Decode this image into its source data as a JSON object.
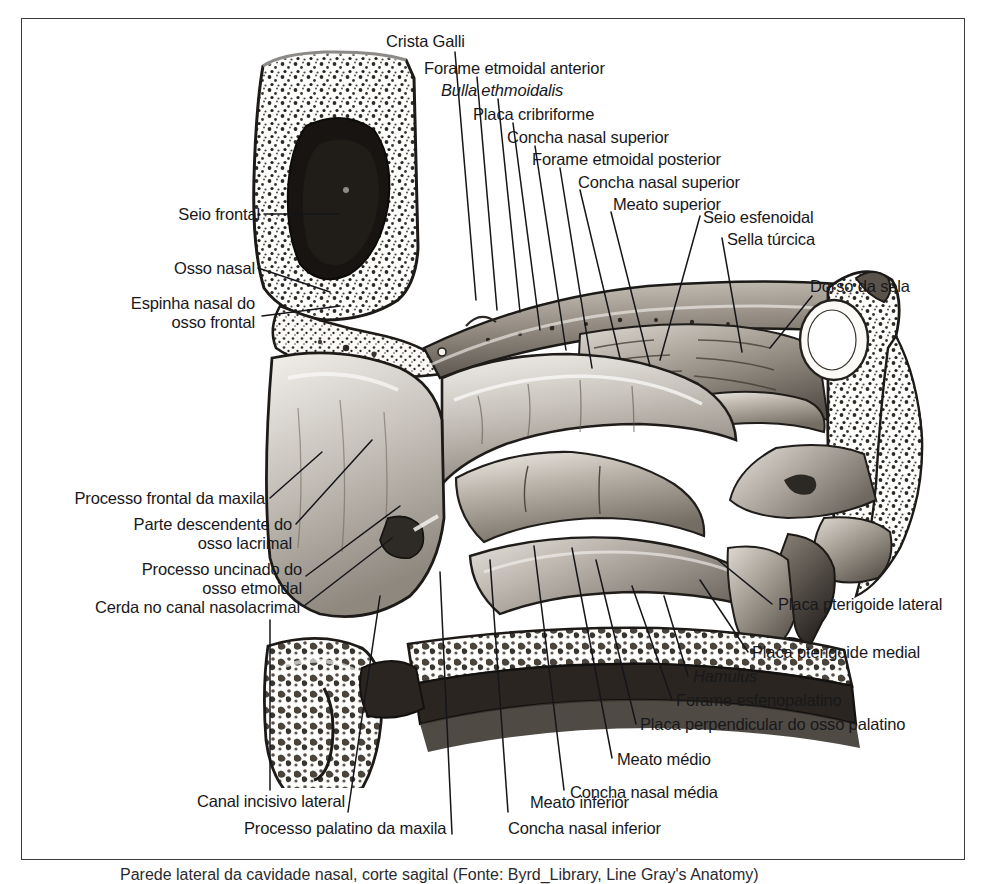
{
  "figure": {
    "language": "pt-BR",
    "frame_color": "#3b3b41",
    "text_color": "#18181c",
    "background": "#ffffff"
  },
  "labels_top": [
    {
      "id": "crista-galli",
      "text": "Crista Galli",
      "italic": false
    },
    {
      "id": "forame-etmoidal-anterior",
      "text": "Forame etmoidal anterior",
      "italic": false
    },
    {
      "id": "bulla-ethmoidalis",
      "text": "Bulla ethmoidalis",
      "italic": true
    },
    {
      "id": "placa-cribriforme",
      "text": "Placa cribriforme",
      "italic": false
    },
    {
      "id": "concha-nasal-superior-1",
      "text": "Concha nasal superior",
      "italic": false
    },
    {
      "id": "forame-etmoidal-posterior",
      "text": "Forame etmoidal posterior",
      "italic": false
    },
    {
      "id": "concha-nasal-superior-2",
      "text": "Concha nasal superior",
      "italic": false
    },
    {
      "id": "meato-superior",
      "text": "Meato superior",
      "italic": false
    },
    {
      "id": "seio-esfenoidal",
      "text": "Seio esfenoidal",
      "italic": false
    },
    {
      "id": "sella-turcica",
      "text": "Sella túrcica",
      "italic": false
    }
  ],
  "labels_left": [
    {
      "id": "seio-frontal",
      "text": "Seio frontal",
      "italic": false
    },
    {
      "id": "osso-nasal",
      "text": "Osso nasal",
      "italic": false
    },
    {
      "id": "espinha-nasal-do-osso-frontal-l1",
      "text": "Espinha nasal do",
      "italic": false
    },
    {
      "id": "espinha-nasal-do-osso-frontal-l2",
      "text": "osso frontal",
      "italic": false
    },
    {
      "id": "processo-frontal-da-maxila",
      "text": "Processo frontal da maxila",
      "italic": false
    },
    {
      "id": "parte-descendente-osso-lacrimal-l1",
      "text": "Parte descendente do",
      "italic": false
    },
    {
      "id": "parte-descendente-osso-lacrimal-l2",
      "text": "osso lacrimal",
      "italic": false
    },
    {
      "id": "processo-uncinado-osso-etmoidal-l1",
      "text": "Processo uncinado do",
      "italic": false
    },
    {
      "id": "processo-uncinado-osso-etmoidal-l2",
      "text": "osso etmoidal",
      "italic": false
    },
    {
      "id": "cerda-no-canal-nasolacrimal",
      "text": "Cerda no canal nasolacrimal",
      "italic": false
    }
  ],
  "labels_right": [
    {
      "id": "dorso-da-sela",
      "text": "Dorso da sela",
      "italic": false
    },
    {
      "id": "placa-pterigoide-lateral",
      "text": "Placa pterigoide lateral",
      "italic": false
    },
    {
      "id": "placa-pterigoide-medial",
      "text": "Placa pterigoide medial",
      "italic": false
    },
    {
      "id": "hamulus",
      "text": "Hamulus",
      "italic": true
    },
    {
      "id": "forame-esfenopalatino",
      "text": "Forame esfenopalatino",
      "italic": false
    },
    {
      "id": "placa-perpendicular-osso-palatino",
      "text": "Placa perpendicular do osso palatino",
      "italic": false
    },
    {
      "id": "meato-medio",
      "text": "Meato médio",
      "italic": false
    },
    {
      "id": "concha-nasal-media",
      "text": "Concha nasal média",
      "italic": false
    }
  ],
  "labels_bottom": [
    {
      "id": "canal-incisivo-lateral",
      "text": "Canal incisivo lateral",
      "italic": false
    },
    {
      "id": "processo-palatino-da-maxila",
      "text": "Processo palatino da maxila",
      "italic": false
    },
    {
      "id": "concha-nasal-inferior",
      "text": "Concha nasal inferior",
      "italic": false
    },
    {
      "id": "meato-inferior",
      "text": "Meato inferior",
      "italic": false
    }
  ],
  "caption": {
    "text": "Parede lateral da cavidade nasal, corte sagital (Fonte: Byrd_Library, Line Gray's Anatomy)"
  }
}
